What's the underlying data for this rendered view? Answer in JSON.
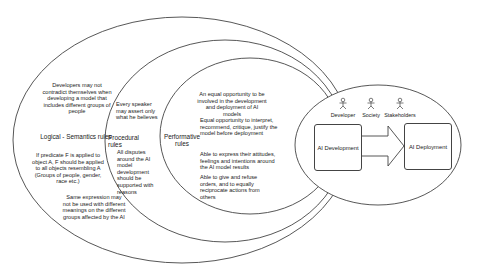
{
  "diagram": {
    "layers": [
      {
        "id": "logical-semantics",
        "title": "Logical - Semantics rules",
        "rules": [
          "Developers may not contradict themselves when developing a model that includes different groups of people",
          "If predicate F is applied to object A, F should be applied to all objects resembling A (Groups of people, gender, race etc.)",
          "Same expression may not be used with different meanings on the different groups affected by the AI"
        ]
      },
      {
        "id": "procedural",
        "title": "Procedural rules",
        "rules": [
          "Every speaker may assert only what he believes",
          "All disputes around the AI model development should be supported with reasons"
        ]
      },
      {
        "id": "performative",
        "title": "Performative rules",
        "rules": [
          "An equal opportunity to be involved in the development and deployment of AI models",
          "Equal opportunity to interpret, recommend, critique, justify the model before deployment",
          "Able to express their attitudes, feelings and intentions around the AI model results",
          "Able to give and refuse orders, and to equally reciprocate actions from others"
        ]
      }
    ],
    "core": {
      "actors": [
        "Developer",
        "Society",
        "Stakeholders"
      ],
      "boxes": [
        "AI Development",
        "AI Deployment"
      ]
    },
    "colors": {
      "stroke": "#444444",
      "text": "#222222",
      "background": "#ffffff"
    }
  }
}
